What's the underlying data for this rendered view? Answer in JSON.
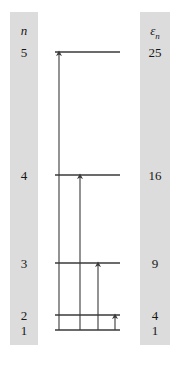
{
  "figure": {
    "type": "energy-level-diagram",
    "title": "",
    "background": "#ffffff",
    "band_color": "#dcdcdc",
    "line_color": "#3a3a3a"
  },
  "columns": {
    "left": {
      "header": "n",
      "header_name": "quantum-number-header"
    },
    "right": {
      "header_symbol": "ε",
      "header_subscript": "n",
      "header_name": "energy-header"
    }
  },
  "chart_data": {
    "type": "line",
    "title": "",
    "xlabel": "",
    "ylabel": "",
    "levels": [
      {
        "n": "5",
        "energy": "25",
        "y": 52,
        "x_left": 55,
        "x_right": 120
      },
      {
        "n": "4",
        "energy": "16",
        "y": 175,
        "x_left": 55,
        "x_right": 120
      },
      {
        "n": "3",
        "energy": "9",
        "y": 263,
        "x_left": 55,
        "x_right": 120
      },
      {
        "n": "2",
        "energy": "4",
        "y": 315,
        "x_left": 55,
        "x_right": 120
      },
      {
        "n": "1",
        "energy": "1",
        "y": 330,
        "x_left": 55,
        "x_right": 120
      }
    ],
    "transitions": [
      {
        "label": "1 to 5",
        "x": 59,
        "y_from": 330,
        "y_to": 52
      },
      {
        "label": "1 to 4",
        "x": 80,
        "y_from": 330,
        "y_to": 175
      },
      {
        "label": "1 to 3",
        "x": 98,
        "y_from": 330,
        "y_to": 263
      },
      {
        "label": "1 to 2",
        "x": 115,
        "y_from": 330,
        "y_to": 315
      }
    ]
  }
}
